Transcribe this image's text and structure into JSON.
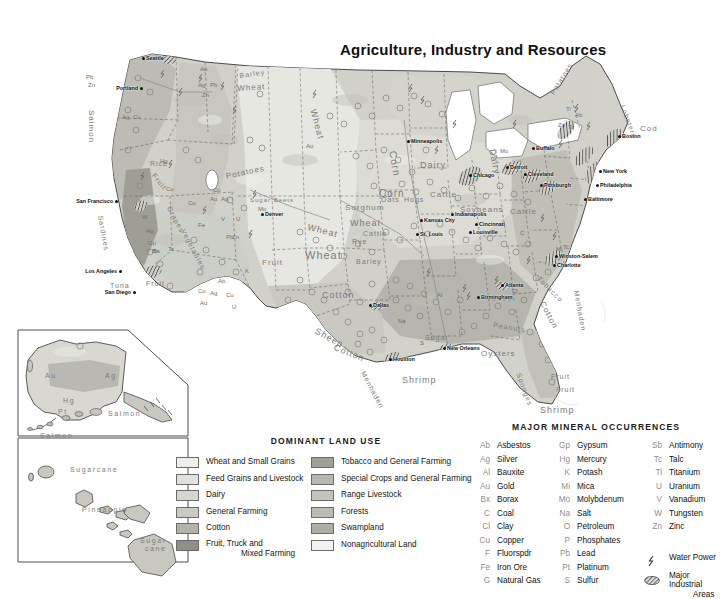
{
  "title": "Agriculture, Industry and Resources",
  "palette": {
    "background": "#ffffff",
    "land_light": "#e9e9e4",
    "land_mid": "#cfcfc8",
    "land_dark": "#a8a8a1",
    "water": "#ffffff",
    "border": "#4c4c4c",
    "text": "#1a1a1a",
    "feature_text": "#7b7b7b"
  },
  "land_use_legend": {
    "heading": "DOMINANT LAND USE",
    "column1": [
      {
        "label": "Wheat and Small Grains",
        "color": "#eeeeea"
      },
      {
        "label": "Feed Grains and Livestock",
        "color": "#e2e2dc"
      },
      {
        "label": "Dairy",
        "color": "#d6d6cf"
      },
      {
        "label": "General Farming",
        "color": "#cacac2"
      },
      {
        "label": "Cotton",
        "color": "#b3b3aa"
      },
      {
        "label": "Fruit, Truck and",
        "label2": "Mixed Farming",
        "color": "#8f8f88"
      }
    ],
    "column2": [
      {
        "label": "Tobacco and General Farming",
        "color": "#a0a098"
      },
      {
        "label": "Special Crops and General Farming",
        "color": "#b8b8b0"
      },
      {
        "label": "Range Livestock",
        "color": "#c4c4bc"
      },
      {
        "label": "Forests",
        "color": "#bcbcb4"
      },
      {
        "label": "Swampland",
        "color": "#aeaea6"
      },
      {
        "label": "Nonagricultural Land",
        "color": "#f2f2ee"
      }
    ]
  },
  "mineral_legend": {
    "heading": "MAJOR MINERAL OCCURRENCES",
    "column1": [
      {
        "abbr": "Ab",
        "name": "Asbestos"
      },
      {
        "abbr": "Ag",
        "name": "Silver"
      },
      {
        "abbr": "Al",
        "name": "Bauxite"
      },
      {
        "abbr": "Au",
        "name": "Gold"
      },
      {
        "abbr": "Bx",
        "name": "Borax"
      },
      {
        "abbr": "C",
        "name": "Coal"
      },
      {
        "abbr": "Cl",
        "name": "Clay"
      },
      {
        "abbr": "Cu",
        "name": "Copper"
      },
      {
        "abbr": "F",
        "name": "Fluorspdr"
      },
      {
        "abbr": "Fe",
        "name": "Iron Ore"
      },
      {
        "abbr": "G",
        "name": "Natural Gas"
      }
    ],
    "column2": [
      {
        "abbr": "Gp",
        "name": "Gypsum"
      },
      {
        "abbr": "Hg",
        "name": "Mercury"
      },
      {
        "abbr": "K",
        "name": "Potash"
      },
      {
        "abbr": "Mi",
        "name": "Mica"
      },
      {
        "abbr": "Mo",
        "name": "Molybdenum"
      },
      {
        "abbr": "Na",
        "name": "Salt"
      },
      {
        "abbr": "O",
        "name": "Petroleum"
      },
      {
        "abbr": "P",
        "name": "Phosphates"
      },
      {
        "abbr": "Pb",
        "name": "Lead"
      },
      {
        "abbr": "Pt",
        "name": "Platinum"
      },
      {
        "abbr": "S",
        "name": "Sulfur"
      }
    ],
    "column3": [
      {
        "abbr": "Sb",
        "name": "Antimony"
      },
      {
        "abbr": "Tc",
        "name": "Talc"
      },
      {
        "abbr": "Ti",
        "name": "Titanium"
      },
      {
        "abbr": "U",
        "name": "Uranium"
      },
      {
        "abbr": "V",
        "name": "Vanadium"
      },
      {
        "abbr": "W",
        "name": "Tungsten"
      },
      {
        "abbr": "Zn",
        "name": "Zinc"
      }
    ],
    "extras": [
      {
        "symbol": "water-power-icon",
        "name": "Water Power"
      },
      {
        "symbol": "major-industrial-areas-icon",
        "name": "Major Industrial",
        "name2": "Areas"
      }
    ]
  },
  "cities": [
    {
      "name": "Seattle",
      "x": 146,
      "y": 58,
      "align": "left"
    },
    {
      "name": "Portland",
      "x": 138,
      "y": 88,
      "align": "right"
    },
    {
      "name": "San Francisco",
      "x": 113,
      "y": 201,
      "align": "right"
    },
    {
      "name": "Los Angeles",
      "x": 117,
      "y": 271,
      "align": "right"
    },
    {
      "name": "San Diego",
      "x": 131,
      "y": 292,
      "align": "right"
    },
    {
      "name": "Denver",
      "x": 265,
      "y": 214,
      "align": "left"
    },
    {
      "name": "Kansas City",
      "x": 424,
      "y": 220,
      "align": "left"
    },
    {
      "name": "St. Louis",
      "x": 420,
      "y": 234,
      "align": "left"
    },
    {
      "name": "Minneapolis",
      "x": 411,
      "y": 141,
      "align": "left"
    },
    {
      "name": "Chicago",
      "x": 473,
      "y": 175,
      "align": "left"
    },
    {
      "name": "Detroit",
      "x": 510,
      "y": 167,
      "align": "left"
    },
    {
      "name": "Cleveland",
      "x": 528,
      "y": 174,
      "align": "left"
    },
    {
      "name": "Buffalo",
      "x": 536,
      "y": 148,
      "align": "left"
    },
    {
      "name": "Pittsburgh",
      "x": 544,
      "y": 185,
      "align": "left"
    },
    {
      "name": "Boston",
      "x": 622,
      "y": 136,
      "align": "left"
    },
    {
      "name": "New York",
      "x": 603,
      "y": 171,
      "align": "left"
    },
    {
      "name": "Philadelphia",
      "x": 600,
      "y": 185,
      "align": "left"
    },
    {
      "name": "Baltimore",
      "x": 588,
      "y": 199,
      "align": "left"
    },
    {
      "name": "Indianapolis",
      "x": 455,
      "y": 214,
      "align": "left"
    },
    {
      "name": "Cincinnati",
      "x": 479,
      "y": 224,
      "align": "left"
    },
    {
      "name": "Louisville",
      "x": 473,
      "y": 232,
      "align": "left"
    },
    {
      "name": "Winston-Salem",
      "x": 559,
      "y": 256,
      "align": "left"
    },
    {
      "name": "Charlotte",
      "x": 557,
      "y": 265,
      "align": "left"
    },
    {
      "name": "Atlanta",
      "x": 505,
      "y": 285,
      "align": "left"
    },
    {
      "name": "Birmingham",
      "x": 481,
      "y": 297,
      "align": "left"
    },
    {
      "name": "Dallas",
      "x": 373,
      "y": 305,
      "align": "left"
    },
    {
      "name": "Houston",
      "x": 393,
      "y": 359,
      "align": "left"
    },
    {
      "name": "New Orleans",
      "x": 447,
      "y": 348,
      "align": "left"
    }
  ],
  "map_features": [
    {
      "text": "Salmon",
      "x": 96,
      "y": 110,
      "size": 8,
      "rot": 90
    },
    {
      "text": "Sardines",
      "x": 104,
      "y": 215,
      "size": 7,
      "rot": 80
    },
    {
      "text": "Tuna",
      "x": 110,
      "y": 282,
      "size": 7,
      "rot": 0
    },
    {
      "text": "Barley",
      "x": 239,
      "y": 72,
      "size": 7,
      "rot": -8
    },
    {
      "text": "Wheat",
      "x": 237,
      "y": 84,
      "size": 8,
      "rot": -4
    },
    {
      "text": "Potatoes",
      "x": 225,
      "y": 172,
      "size": 8,
      "rot": -12
    },
    {
      "text": "Potatoes",
      "x": 549,
      "y": 92,
      "size": 7,
      "rot": -58
    },
    {
      "text": "Lobsters",
      "x": 626,
      "y": 104,
      "size": 7,
      "rot": 70
    },
    {
      "text": "Cod",
      "x": 640,
      "y": 124,
      "size": 8,
      "rot": 0
    },
    {
      "text": "Wheat",
      "x": 318,
      "y": 108,
      "size": 9,
      "rot": 75
    },
    {
      "text": "Corn",
      "x": 398,
      "y": 150,
      "size": 10,
      "rot": 80
    },
    {
      "text": "Dairy",
      "x": 420,
      "y": 160,
      "size": 9,
      "rot": 0
    },
    {
      "text": "Dairy",
      "x": 497,
      "y": 148,
      "size": 9,
      "rot": 78
    },
    {
      "text": "Corn",
      "x": 379,
      "y": 188,
      "size": 10,
      "rot": 0
    },
    {
      "text": "Oats",
      "x": 381,
      "y": 196,
      "size": 7,
      "rot": 0
    },
    {
      "text": "Hogs",
      "x": 404,
      "y": 196,
      "size": 7,
      "rot": 0
    },
    {
      "text": "Cattle",
      "x": 430,
      "y": 190,
      "size": 8,
      "rot": 0
    },
    {
      "text": "Cattle",
      "x": 510,
      "y": 207,
      "size": 8,
      "rot": 0
    },
    {
      "text": "Soybeans",
      "x": 460,
      "y": 205,
      "size": 8,
      "rot": 0
    },
    {
      "text": "Sorghum",
      "x": 345,
      "y": 203,
      "size": 8,
      "rot": 0
    },
    {
      "text": "Wheat",
      "x": 309,
      "y": 222,
      "size": 9,
      "rot": 14
    },
    {
      "text": "Wheat",
      "x": 350,
      "y": 218,
      "size": 9,
      "rot": 0
    },
    {
      "text": "Cattle",
      "x": 363,
      "y": 230,
      "size": 7,
      "rot": 0
    },
    {
      "text": "Rye",
      "x": 352,
      "y": 238,
      "size": 7,
      "rot": 0
    },
    {
      "text": "Wheat",
      "x": 305,
      "y": 249,
      "size": 11,
      "rot": 0
    },
    {
      "text": "Barley",
      "x": 356,
      "y": 258,
      "size": 7,
      "rot": 0
    },
    {
      "text": "Cotton",
      "x": 322,
      "y": 290,
      "size": 9,
      "rot": 0
    },
    {
      "text": "Sheep",
      "x": 318,
      "y": 326,
      "size": 9,
      "rot": 28
    },
    {
      "text": "Cotton",
      "x": 336,
      "y": 342,
      "size": 9,
      "rot": 22
    },
    {
      "text": "Sugar",
      "x": 425,
      "y": 334,
      "size": 7,
      "rot": 0
    },
    {
      "text": "Oysters",
      "x": 481,
      "y": 349,
      "size": 8,
      "rot": 0
    },
    {
      "text": "Shrimp",
      "x": 402,
      "y": 375,
      "size": 9,
      "rot": 0
    },
    {
      "text": "Shrimp",
      "x": 540,
      "y": 405,
      "size": 9,
      "rot": 0
    },
    {
      "text": "Sponges",
      "x": 522,
      "y": 372,
      "size": 7,
      "rot": 70
    },
    {
      "text": "Menhaden",
      "x": 366,
      "y": 370,
      "size": 7,
      "rot": 62
    },
    {
      "text": "Menhaden",
      "x": 580,
      "y": 290,
      "size": 7,
      "rot": 80
    },
    {
      "text": "Cotton",
      "x": 546,
      "y": 300,
      "size": 8,
      "rot": 62
    },
    {
      "text": "Peanuts",
      "x": 494,
      "y": 321,
      "size": 7,
      "rot": 10
    },
    {
      "text": "Tobacco",
      "x": 541,
      "y": 275,
      "size": 7,
      "rot": 45
    },
    {
      "text": "Fruit",
      "x": 262,
      "y": 258,
      "size": 8,
      "rot": 0
    },
    {
      "text": "Fruit",
      "x": 156,
      "y": 172,
      "size": 7,
      "rot": 50
    },
    {
      "text": "Rice",
      "x": 150,
      "y": 160,
      "size": 7,
      "rot": 0
    },
    {
      "text": "Grapes",
      "x": 172,
      "y": 205,
      "size": 7,
      "rot": 62
    },
    {
      "text": "Vegetables",
      "x": 186,
      "y": 228,
      "size": 7,
      "rot": 62
    },
    {
      "text": "Fruit",
      "x": 146,
      "y": 280,
      "size": 7,
      "rot": 0
    },
    {
      "text": "Sugar Beets",
      "x": 250,
      "y": 197,
      "size": 6,
      "rot": 0
    },
    {
      "text": "Fruit",
      "x": 551,
      "y": 373,
      "size": 7,
      "rot": 0
    },
    {
      "text": "Fruit",
      "x": 556,
      "y": 386,
      "size": 7,
      "rot": 0
    }
  ],
  "mineral_marks": [
    {
      "t": "Au",
      "x": 200,
      "y": 66
    },
    {
      "t": "Pb",
      "x": 86,
      "y": 74
    },
    {
      "t": "Zn",
      "x": 88,
      "y": 82
    },
    {
      "t": "Ag",
      "x": 198,
      "y": 82
    },
    {
      "t": "Pb",
      "x": 210,
      "y": 82
    },
    {
      "t": "Zn",
      "x": 202,
      "y": 92
    },
    {
      "t": "Ag",
      "x": 122,
      "y": 114
    },
    {
      "t": "Cu",
      "x": 133,
      "y": 114
    },
    {
      "t": "Hg",
      "x": 160,
      "y": 158
    },
    {
      "t": "Cu",
      "x": 166,
      "y": 186
    },
    {
      "t": "Cu",
      "x": 213,
      "y": 187
    },
    {
      "t": "Au",
      "x": 210,
      "y": 196
    },
    {
      "t": "Ag",
      "x": 221,
      "y": 196
    },
    {
      "t": "Cu",
      "x": 188,
      "y": 200
    },
    {
      "t": "W",
      "x": 142,
      "y": 214
    },
    {
      "t": "Fe",
      "x": 198,
      "y": 222
    },
    {
      "t": "Hg",
      "x": 146,
      "y": 228
    },
    {
      "t": "Gp",
      "x": 148,
      "y": 240
    },
    {
      "t": "Bx",
      "x": 152,
      "y": 248
    },
    {
      "t": "V",
      "x": 221,
      "y": 216
    },
    {
      "t": "Bx",
      "x": 153,
      "y": 248
    },
    {
      "t": "Tc",
      "x": 168,
      "y": 246
    },
    {
      "t": "Ab",
      "x": 218,
      "y": 278
    },
    {
      "t": "U",
      "x": 236,
      "y": 216
    },
    {
      "t": "Cu",
      "x": 198,
      "y": 288
    },
    {
      "t": "Ag",
      "x": 210,
      "y": 290
    },
    {
      "t": "Cu",
      "x": 226,
      "y": 292
    },
    {
      "t": "Au",
      "x": 200,
      "y": 300
    },
    {
      "t": "U",
      "x": 232,
      "y": 304
    },
    {
      "t": "Mo",
      "x": 258,
      "y": 206
    },
    {
      "t": "Pb",
      "x": 226,
      "y": 234
    },
    {
      "t": "Zn",
      "x": 232,
      "y": 234
    },
    {
      "t": "Au",
      "x": 306,
      "y": 143
    },
    {
      "t": "Mo",
      "x": 500,
      "y": 148
    },
    {
      "t": "Zn",
      "x": 558,
      "y": 122
    },
    {
      "t": "Tc",
      "x": 568,
      "y": 124
    },
    {
      "t": "Ab",
      "x": 575,
      "y": 112
    },
    {
      "t": "Ti",
      "x": 566,
      "y": 106
    },
    {
      "t": "Mi",
      "x": 556,
      "y": 246
    },
    {
      "t": "Tc",
      "x": 563,
      "y": 244
    },
    {
      "t": "Al",
      "x": 437,
      "y": 292
    },
    {
      "t": "Na",
      "x": 398,
      "y": 318
    },
    {
      "t": "C",
      "x": 520,
      "y": 230
    },
    {
      "t": "Cl",
      "x": 512,
      "y": 288
    },
    {
      "t": "S",
      "x": 420,
      "y": 340
    },
    {
      "t": "K",
      "x": 245,
      "y": 268
    }
  ],
  "alaska_inset": {
    "labels": [
      {
        "text": "Au",
        "x": 45,
        "y": 372
      },
      {
        "text": "Ag",
        "x": 105,
        "y": 372
      },
      {
        "text": "Hg",
        "x": 63,
        "y": 397
      },
      {
        "text": "Pt",
        "x": 58,
        "y": 408
      },
      {
        "text": "Salmon",
        "x": 108,
        "y": 410
      },
      {
        "text": "Salmon",
        "x": 40,
        "y": 432
      }
    ]
  },
  "hawaii_inset": {
    "labels": [
      {
        "text": "Sugarcane",
        "x": 70,
        "y": 466
      },
      {
        "text": "Pineapple",
        "x": 82,
        "y": 506
      },
      {
        "text": "Sugar-",
        "x": 140,
        "y": 537
      },
      {
        "text": "cane",
        "x": 145,
        "y": 545
      }
    ]
  }
}
